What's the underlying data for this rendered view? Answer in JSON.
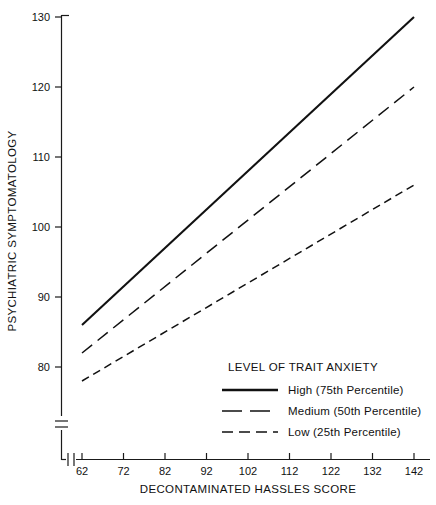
{
  "chart_data": {
    "type": "line",
    "title": "",
    "xlabel": "DECONTAMINATED HASSLES SCORE",
    "ylabel": "PSYCHIATRIC SYMPTOMATOLOGY",
    "x": [
      62,
      142
    ],
    "xticks": [
      62,
      72,
      82,
      92,
      102,
      112,
      122,
      132,
      142
    ],
    "yticks": [
      80,
      90,
      100,
      110,
      120,
      130
    ],
    "xlim": [
      62,
      142
    ],
    "ylim": [
      80,
      130
    ],
    "grid": false,
    "axis_break_x": true,
    "axis_break_y": true,
    "legend_position": "lower-right",
    "legend_title": "LEVEL OF TRAIT ANXIETY",
    "series": [
      {
        "name": "High (75th Percentile)",
        "style": "solid",
        "x": [
          62,
          142
        ],
        "values": [
          86,
          130
        ]
      },
      {
        "name": "Medium (50th Percentile)",
        "style": "long-dash",
        "x": [
          62,
          142
        ],
        "values": [
          82,
          120
        ]
      },
      {
        "name": "Low (25th Percentile)",
        "style": "short-dash",
        "x": [
          62,
          142
        ],
        "values": [
          78,
          106
        ]
      }
    ]
  },
  "axes": {
    "y_title": "PSYCHIATRIC SYMPTOMATOLOGY",
    "x_title": "DECONTAMINATED HASSLES SCORE",
    "y_tick_labels": [
      "130",
      "120",
      "110",
      "100",
      "90",
      "80"
    ],
    "x_tick_labels": [
      "62",
      "72",
      "82",
      "92",
      "102",
      "112",
      "122",
      "132",
      "142"
    ]
  },
  "legend": {
    "title": "LEVEL OF TRAIT ANXIETY",
    "entries": [
      {
        "label": "High (75th Percentile)"
      },
      {
        "label": "Medium (50th Percentile)"
      },
      {
        "label": "Low (25th Percentile)"
      }
    ]
  },
  "colors": {
    "ink": "#111111",
    "background": "#ffffff"
  }
}
